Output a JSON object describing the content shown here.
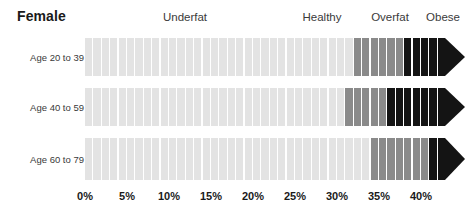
{
  "title": "Female",
  "category_headers": [
    {
      "label": "Underfat",
      "center_x": 185
    },
    {
      "label": "Healthy",
      "center_x": 322
    },
    {
      "label": "Overfat",
      "center_x": 390
    },
    {
      "label": "Obese",
      "center_x": 443
    }
  ],
  "axis": {
    "ticks": [
      "0%",
      "5%",
      "10%",
      "15%",
      "20%",
      "25%",
      "30%",
      "35%",
      "40%"
    ],
    "tick_values": [
      0,
      5,
      10,
      15,
      20,
      25,
      30,
      35,
      40
    ],
    "tick_x": [
      85,
      127,
      169,
      211,
      253,
      295,
      337,
      379,
      421
    ]
  },
  "rows": [
    {
      "label": "Age 20 to 39",
      "center_y": 57,
      "underfat_end": 32,
      "overfat_end": 37.5,
      "obese_end": 43
    },
    {
      "label": "Age 40 to 59",
      "center_y": 107,
      "underfat_end": 31,
      "overfat_end": 36,
      "obese_end": 43
    },
    {
      "label": "Age 60 to 79",
      "center_y": 159,
      "underfat_end": 34,
      "overfat_end": 41,
      "obese_end": 43
    }
  ],
  "colors": {
    "light_gray": "#e3e3e3",
    "medium_gray": "#8a8a8a",
    "black": "#141414",
    "gap": "#ffffff",
    "text": "#3a3a3a",
    "title_text": "#1a1a1a"
  },
  "chart_data": {
    "type": "bar",
    "title": "Female",
    "xlabel": "",
    "ylabel": "",
    "xlim": [
      0,
      43
    ],
    "grid": false,
    "legend": "top",
    "orientation": "horizontal",
    "note": "Stacked horizontal body-fat percentage ranges by age group; each bar is segmented into 1% ticks and terminates in a black arrowhead indicating an open-ended obese range.",
    "categories": [
      "Age 20 to 39",
      "Age 40 to 59",
      "Age 60 to 79"
    ],
    "legend_entries": [
      "Underfat",
      "Healthy",
      "Overfat",
      "Obese"
    ],
    "series": [
      {
        "name": "Underfat + Healthy (light gray)",
        "values": [
          32,
          31,
          34
        ]
      },
      {
        "name": "Overfat (medium gray)",
        "values": [
          5.5,
          5,
          7
        ]
      },
      {
        "name": "Obese (black)",
        "values": [
          5.5,
          7,
          2
        ]
      }
    ],
    "bands": [
      {
        "name": "Underfat",
        "color": "#e3e3e3"
      },
      {
        "name": "Healthy",
        "color": "#e3e3e3"
      },
      {
        "name": "Overfat",
        "color": "#8a8a8a"
      },
      {
        "name": "Obese",
        "color": "#141414"
      }
    ],
    "xticks": [
      0,
      5,
      10,
      15,
      20,
      25,
      30,
      35,
      40
    ],
    "xticklabels": [
      "0%",
      "5%",
      "10%",
      "15%",
      "20%",
      "25%",
      "30%",
      "35%",
      "40%"
    ]
  }
}
